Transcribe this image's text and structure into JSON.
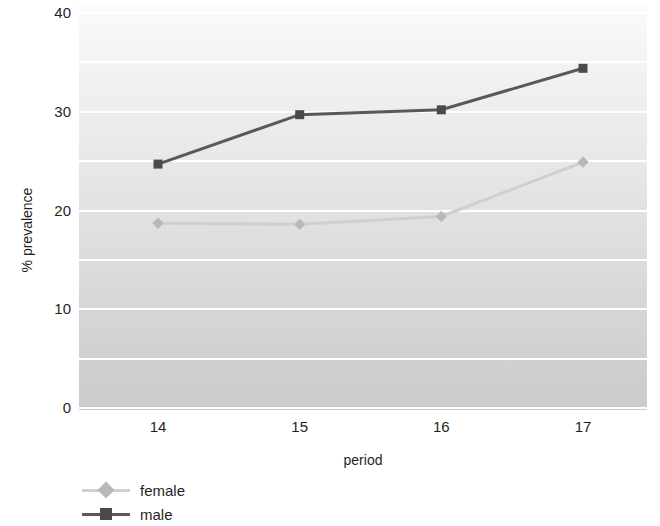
{
  "chart_data": {
    "type": "line",
    "title": "",
    "xlabel": "period",
    "ylabel": "% prevalence",
    "categories": [
      "14",
      "15",
      "16",
      "17"
    ],
    "x": [
      14,
      15,
      16,
      17
    ],
    "ylim": [
      0,
      40
    ],
    "y_ticks": [
      "0",
      "10",
      "20",
      "30",
      "40"
    ],
    "y_tick_values": [
      0,
      10,
      20,
      30,
      40
    ],
    "gridlines": [
      0,
      5,
      10,
      15,
      20,
      25,
      30,
      35,
      40
    ],
    "grid": true,
    "grid_color": "#ffffff",
    "legend_position": "bottom-left",
    "series": [
      {
        "name": "female",
        "values": [
          18.7,
          18.6,
          19.4,
          24.9
        ],
        "color": "#cfcfcf",
        "marker": "diamond",
        "marker_color": "#b8b8b8"
      },
      {
        "name": "male",
        "values": [
          24.7,
          29.7,
          30.2,
          34.4
        ],
        "color": "#595959",
        "marker": "square",
        "marker_color": "#4a4a4a"
      }
    ]
  },
  "axes": {
    "y_title": "% prevalence",
    "x_title": "period",
    "y_tick_labels": [
      "40",
      "30",
      "20",
      "10",
      "0"
    ],
    "x_tick_labels": [
      "14",
      "15",
      "16",
      "17"
    ]
  },
  "legend": {
    "items": [
      {
        "label": "female"
      },
      {
        "label": "male"
      }
    ]
  }
}
